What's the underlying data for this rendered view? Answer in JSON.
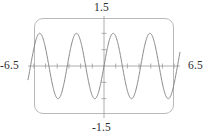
{
  "figure": {
    "kind": "graphing-calculator-viewing-window",
    "frame_color": "#b9b9b9",
    "curve_color": "#7a7a7a",
    "axis_color": "#9a9a9a",
    "text_color": "#2b2b2b"
  },
  "labels": {
    "x_min": "-6.5",
    "x_max": "6.5",
    "y_max": "1.5",
    "y_min": "-1.5"
  },
  "chart_data": {
    "type": "line",
    "title": "",
    "xlabel": "",
    "ylabel": "",
    "xlim": [
      -6.5,
      6.5
    ],
    "ylim": [
      -1.5,
      1.5
    ],
    "grid": false,
    "legend": "none",
    "xticks": [
      -6,
      -5,
      -4,
      -3,
      -2,
      -1,
      0,
      1,
      2,
      3,
      4,
      5,
      6
    ],
    "yticks": [
      -1.0,
      -0.5,
      0.5,
      1.0
    ],
    "tick_labels_shown": false,
    "corner_labels": {
      "top": "1.5",
      "bottom": "-1.5",
      "left": "-6.5",
      "right": "6.5"
    },
    "series": [
      {
        "name": "y = sin(2x)",
        "amplitude": 1.0,
        "period": 3.1416,
        "x": [
          -6.5,
          -6.25,
          -6.0,
          -5.75,
          -5.5,
          -5.25,
          -5.0,
          -4.75,
          -4.5,
          -4.25,
          -4.0,
          -3.75,
          -3.5,
          -3.25,
          -3.0,
          -2.75,
          -2.5,
          -2.25,
          -2.0,
          -1.75,
          -1.5,
          -1.25,
          -1.0,
          -0.75,
          -0.5,
          -0.25,
          0.0,
          0.25,
          0.5,
          0.75,
          1.0,
          1.25,
          1.5,
          1.75,
          2.0,
          2.25,
          2.5,
          2.75,
          3.0,
          3.25,
          3.5,
          3.75,
          4.0,
          4.25,
          4.5,
          4.75,
          5.0,
          5.25,
          5.5,
          5.75,
          6.0,
          6.25,
          6.5
        ],
        "y": [
          -0.22,
          0.26,
          0.7,
          0.95,
          0.97,
          0.76,
          0.38,
          -0.09,
          -0.54,
          -0.86,
          -0.99,
          -0.9,
          -0.6,
          -0.16,
          0.28,
          0.71,
          0.96,
          0.97,
          0.76,
          0.38,
          -0.14,
          -0.6,
          -0.91,
          -1.0,
          -0.84,
          -0.48,
          0.0,
          0.48,
          0.84,
          1.0,
          0.91,
          0.6,
          0.14,
          -0.38,
          -0.76,
          -0.97,
          -0.96,
          -0.71,
          -0.28,
          0.16,
          0.6,
          0.9,
          0.99,
          0.86,
          0.54,
          0.09,
          -0.38,
          -0.76,
          -0.97,
          -0.95,
          -0.7,
          -0.26,
          0.22
        ]
      }
    ]
  }
}
